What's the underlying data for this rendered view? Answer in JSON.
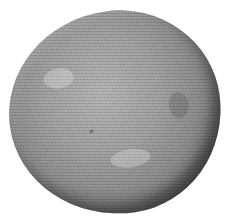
{
  "image": {
    "subject": "engraved illustration of a rounded stone",
    "background_color": "#ffffff",
    "stone_tone_light": "#b8b8b8",
    "stone_tone_dark": "#2e2e2e"
  }
}
